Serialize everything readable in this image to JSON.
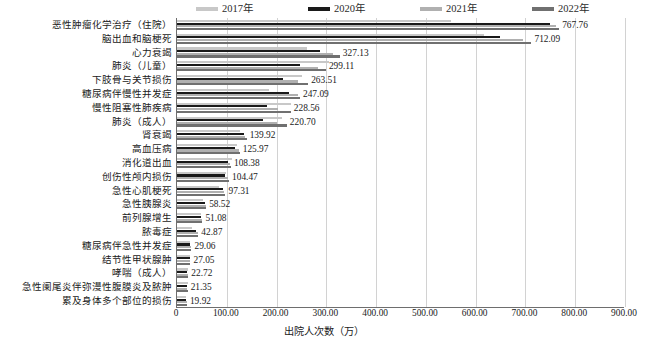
{
  "chart_data": {
    "type": "bar",
    "orientation": "horizontal",
    "title": "",
    "xlabel": "出院人次数（万）",
    "ylabel": "",
    "xlim": [
      0,
      900
    ],
    "xticks": [
      "0",
      "100.00",
      "200.00",
      "300.00",
      "400.00",
      "500.00",
      "600.00",
      "700.00",
      "800.00",
      "900.00"
    ],
    "grid": true,
    "legend_position": "top",
    "categories": [
      "恶性肿瘤化学治疗（住院）",
      "脑出血和脑梗死",
      "心力衰竭",
      "肺炎（儿童）",
      "下肢骨与关节损伤",
      "糖尿病伴慢性并发症",
      "慢性阻塞性肺疾病",
      "肺炎（成人）",
      "肾衰竭",
      "高血压病",
      "消化道出血",
      "创伤性颅内损伤",
      "急性心肌梗死",
      "急性胰腺炎",
      "前列腺增生",
      "脓毒症",
      "糖尿病伴急性并发症",
      "结节性甲状腺肿",
      "哮喘（成人）",
      "急性阑尾炎伴弥漫性腹膜炎及脓肿",
      "累及身体多个部位的损伤"
    ],
    "series": [
      {
        "name": "2017年",
        "color": "#c8c8c8",
        "values": [
          550.2,
          617.5,
          261.4,
          305.4,
          251.6,
          185.3,
          228.8,
          210.5,
          126.4,
          120.1,
          110.2,
          99.3,
          83.4,
          52.1,
          48.6,
          30.5,
          25.8,
          25.4,
          22.1,
          21.8,
          17.6
        ]
      },
      {
        "name": "2020年",
        "color": "#1a1a1a",
        "values": [
          749.8,
          648.7,
          287.3,
          247.9,
          213.6,
          225.8,
          180.4,
          172.3,
          133.7,
          116.5,
          101.5,
          96.2,
          92.8,
          55.4,
          47.9,
          38.6,
          26.9,
          25.9,
          19.8,
          19.1,
          18.4
        ]
      },
      {
        "name": "2021年",
        "color": "#b0b0b0",
        "values": [
          761.3,
          694.2,
          313.6,
          282.5,
          243.1,
          243.4,
          203.2,
          201.7,
          137.2,
          123.8,
          105.9,
          101.8,
          95.1,
          57.3,
          49.8,
          41.2,
          28.1,
          26.7,
          21.6,
          20.6,
          19.3
        ]
      },
      {
        "name": "2022年",
        "color": "#707070",
        "values": [
          767.76,
          712.09,
          327.13,
          299.11,
          263.51,
          247.09,
          228.56,
          220.7,
          139.92,
          125.97,
          108.38,
          104.47,
          97.31,
          58.52,
          51.08,
          42.87,
          29.06,
          27.05,
          22.72,
          21.35,
          19.92
        ]
      }
    ],
    "value_labels": [
      "767.76",
      "712.09",
      "327.13",
      "299.11",
      "263.51",
      "247.09",
      "228.56",
      "220.70",
      "139.92",
      "125.97",
      "108.38",
      "104.47",
      "97.31",
      "58.52",
      "51.08",
      "42.87",
      "29.06",
      "27.05",
      "22.72",
      "21.35",
      "19.92"
    ]
  },
  "legend": {
    "items": [
      {
        "label": "2017年",
        "color": "#c8c8c8"
      },
      {
        "label": "2020年",
        "color": "#1a1a1a"
      },
      {
        "label": "2021年",
        "color": "#b0b0b0"
      },
      {
        "label": "2022年",
        "color": "#707070"
      }
    ]
  },
  "caption": ""
}
